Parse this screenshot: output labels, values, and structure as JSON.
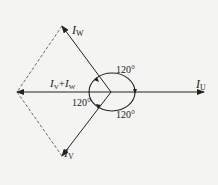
{
  "diagram": {
    "type": "phasor-diagram",
    "background": "#f4f4f2",
    "stroke_color": "#222222",
    "labels": {
      "iw_main": "I",
      "iw_sub": "W",
      "iv_main": "I",
      "iv_sub": "V",
      "iu_main": "I",
      "iu_sub": "U",
      "sum_i1": "I",
      "sum_s1": "V",
      "sum_plus": "+",
      "sum_i2": "I",
      "sum_s2": "W",
      "angle_top": "120°",
      "angle_left": "120°",
      "angle_bottom": "120°"
    }
  }
}
